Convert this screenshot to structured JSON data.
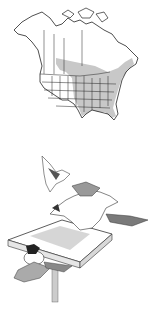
{
  "map": {
    "subject": "range-map-north-america",
    "colors": {
      "range": "#c8c8c8",
      "outline": "#222222",
      "background": "#ffffff"
    }
  },
  "illustration": {
    "subject": "birds-at-feeder",
    "colors": {
      "ink": "#333333",
      "shade": "#9a9a9a",
      "background": "#ffffff"
    }
  }
}
